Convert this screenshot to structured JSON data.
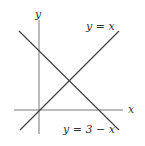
{
  "figure": {
    "axes": {
      "x_label": "x",
      "y_label": "y",
      "color": "#777777"
    },
    "lines": [
      {
        "label": "y = x",
        "color": "#444444"
      },
      {
        "label": "y = 3 − x",
        "color": "#444444"
      }
    ],
    "intersection": {
      "x": 1.5,
      "y": 1.5
    },
    "intercepts": {
      "line2_y_intercept": 3,
      "line2_x_intercept": 3
    }
  }
}
